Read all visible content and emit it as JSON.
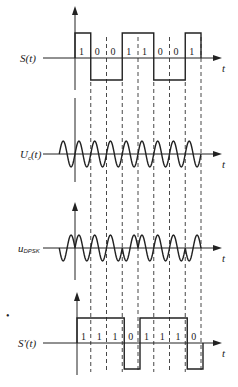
{
  "figure": {
    "bit_width_px": 15.75,
    "origin_x": 75,
    "panels": [
      {
        "id": "source",
        "label": "S(t)",
        "axis_y": 58,
        "bits": [
          1,
          0,
          0,
          1,
          1,
          0,
          0,
          1
        ],
        "x_axis_label": "t"
      },
      {
        "id": "carrier",
        "label_main": "U",
        "label_sub": "c",
        "label_tail": "(t)",
        "axis_y": 154,
        "x_axis_label": "t"
      },
      {
        "id": "dpsk",
        "label_main": "u",
        "label_sub": "DPSK",
        "axis_y": 248,
        "reference_phase": "π",
        "phases": [
          "0",
          "0",
          "0",
          "π",
          "0",
          "0",
          "0",
          "π"
        ],
        "x_axis_label": "t"
      },
      {
        "id": "relative",
        "label": "S'(t)",
        "axis_y": 343,
        "bits": [
          1,
          1,
          1,
          0,
          1,
          1,
          1,
          0
        ],
        "x_axis_label": "t"
      }
    ],
    "stray_mark": "•"
  }
}
